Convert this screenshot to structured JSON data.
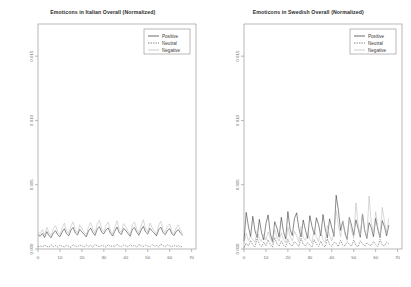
{
  "figure": {
    "background": "#ffffff",
    "panel_count": 2
  },
  "chart_data": [
    {
      "type": "line",
      "title": "Emoticons in Italian Overall (Normalized)",
      "xlabel": "",
      "ylabel": "",
      "xlim": [
        0,
        72
      ],
      "ylim": [
        0.0,
        0.0175
      ],
      "xticks": [
        0,
        10,
        20,
        30,
        40,
        50,
        60,
        70
      ],
      "xtick_labels": [
        "0",
        "10",
        "20",
        "30",
        "40",
        "50",
        "60",
        "70"
      ],
      "yticks": [
        0.0,
        0.005,
        0.01,
        0.015
      ],
      "ytick_labels": [
        "0.000",
        "0.005",
        "0.010",
        "0.015"
      ],
      "grid": false,
      "legend_position": "top-right",
      "legend_entries": [
        {
          "label": "Positive",
          "style": "solid",
          "color": "#2b2b2b"
        },
        {
          "label": "Neutral",
          "style": "dashed",
          "color": "#4a4a4a"
        },
        {
          "label": "Negative",
          "style": "solid",
          "color": "#b8b8b8"
        }
      ],
      "x": [
        0,
        1,
        2,
        3,
        4,
        5,
        6,
        7,
        8,
        9,
        10,
        11,
        12,
        13,
        14,
        15,
        16,
        17,
        18,
        19,
        20,
        21,
        22,
        23,
        24,
        25,
        26,
        27,
        28,
        29,
        30,
        31,
        32,
        33,
        34,
        35,
        36,
        37,
        38,
        39,
        40,
        41,
        42,
        43,
        44,
        45,
        46,
        47,
        48,
        49,
        50,
        51,
        52,
        53,
        54,
        55,
        56,
        57,
        58,
        59,
        60,
        61,
        62,
        63,
        64,
        65,
        66
      ],
      "series": [
        {
          "name": "Positive",
          "style": "solid",
          "color": "#2b2b2b",
          "values": [
            0.00112,
            0.00098,
            0.00121,
            0.0009,
            0.00135,
            0.00104,
            0.00088,
            0.00126,
            0.00142,
            0.0011,
            0.00096,
            0.00131,
            0.00158,
            0.00119,
            0.00102,
            0.00147,
            0.00168,
            0.00124,
            0.00109,
            0.00152,
            0.00133,
            0.00115,
            0.00094,
            0.00141,
            0.00162,
            0.00128,
            0.00106,
            0.00155,
            0.00173,
            0.00131,
            0.00118,
            0.00149,
            0.00164,
            0.00122,
            0.00101,
            0.00138,
            0.00171,
            0.00126,
            0.00113,
            0.00159,
            0.00145,
            0.0012,
            0.00099,
            0.00154,
            0.00167,
            0.0013,
            0.00107,
            0.00148,
            0.00176,
            0.00133,
            0.00116,
            0.00161,
            0.0014,
            0.00123,
            0.00102,
            0.00151,
            0.00169,
            0.00127,
            0.00111,
            0.00144,
            0.00158,
            0.00119,
            0.00105,
            0.00137,
            0.0015,
            0.00122,
            0.00108
          ]
        },
        {
          "name": "Neutral",
          "style": "dashed",
          "color": "#4a4a4a",
          "values": [
            0.00018,
            0.00024,
            0.00016,
            0.00029,
            0.00021,
            0.00014,
            0.00033,
            0.00019,
            0.00026,
            0.00015,
            0.00031,
            0.00022,
            0.00017,
            0.00028,
            0.0002,
            0.00013,
            0.00035,
            0.00023,
            0.00018,
            0.0003,
            0.00025,
            0.00016,
            0.00032,
            0.00021,
            0.00027,
            0.00014,
            0.00036,
            0.00024,
            0.00019,
            0.00029,
            0.00022,
            0.00015,
            0.00034,
            0.0002,
            0.00026,
            0.00017,
            0.00038,
            0.00023,
            0.00018,
            0.00031,
            0.00025,
            0.00016,
            0.00033,
            0.00021,
            0.00028,
            0.00014,
            0.00037,
            0.00024,
            0.0002,
            0.0003,
            0.00023,
            0.00017,
            0.00035,
            0.00022,
            0.00027,
            0.00015,
            0.00039,
            0.00025,
            0.00019,
            0.00032,
            0.00024,
            0.00018,
            0.00029,
            0.00021,
            0.00026,
            0.00016,
            0.00023
          ]
        },
        {
          "name": "Negative",
          "style": "solid",
          "color": "#b8b8b8",
          "values": [
            0.00132,
            0.00118,
            0.00151,
            0.00108,
            0.00169,
            0.00126,
            0.00104,
            0.00158,
            0.00182,
            0.00134,
            0.00112,
            0.00163,
            0.00201,
            0.00143,
            0.0012,
            0.00178,
            0.00212,
            0.00148,
            0.00126,
            0.00189,
            0.00161,
            0.00131,
            0.0011,
            0.00172,
            0.00205,
            0.00152,
            0.00124,
            0.00193,
            0.00224,
            0.00156,
            0.00135,
            0.00184,
            0.00208,
            0.00144,
            0.00116,
            0.00171,
            0.00219,
            0.0015,
            0.00129,
            0.00198,
            0.00174,
            0.00139,
            0.00112,
            0.0019,
            0.00211,
            0.00155,
            0.00122,
            0.00181,
            0.00228,
            0.00158,
            0.00133,
            0.00202,
            0.00168,
            0.00141,
            0.00115,
            0.00186,
            0.00215,
            0.00149,
            0.00127,
            0.00177,
            0.00196,
            0.00137,
            0.00119,
            0.00165,
            0.00188,
            0.00142,
            0.00124
          ]
        }
      ]
    },
    {
      "type": "line",
      "title": "Emoticons in Swedish Overall (Normalized)",
      "xlabel": "",
      "ylabel": "",
      "xlim": [
        0,
        72
      ],
      "ylim": [
        0.0,
        0.0175
      ],
      "xticks": [
        0,
        10,
        20,
        30,
        40,
        50,
        60,
        70
      ],
      "xtick_labels": [
        "0",
        "10",
        "20",
        "30",
        "40",
        "50",
        "60",
        "70"
      ],
      "yticks": [
        0.0,
        0.005,
        0.01,
        0.015
      ],
      "ytick_labels": [
        "0.000",
        "0.005",
        "0.010",
        "0.015"
      ],
      "grid": false,
      "legend_position": "top-right",
      "legend_entries": [
        {
          "label": "Positive",
          "style": "solid",
          "color": "#2b2b2b"
        },
        {
          "label": "Neutral",
          "style": "dashed",
          "color": "#4a4a4a"
        },
        {
          "label": "Negative",
          "style": "solid",
          "color": "#b8b8b8"
        }
      ],
      "x": [
        0,
        1,
        2,
        3,
        4,
        5,
        6,
        7,
        8,
        9,
        10,
        11,
        12,
        13,
        14,
        15,
        16,
        17,
        18,
        19,
        20,
        21,
        22,
        23,
        24,
        25,
        26,
        27,
        28,
        29,
        30,
        31,
        32,
        33,
        34,
        35,
        36,
        37,
        38,
        39,
        40,
        41,
        42,
        43,
        44,
        45,
        46,
        47,
        48,
        49,
        50,
        51,
        52,
        53,
        54,
        55,
        56,
        57,
        58,
        59,
        60,
        61,
        62,
        63,
        64,
        65,
        66
      ],
      "series": [
        {
          "name": "Positive",
          "style": "solid",
          "color": "#2b2b2b",
          "values": [
            0.00062,
            0.00285,
            0.00178,
            0.00096,
            0.00254,
            0.00142,
            0.00088,
            0.00231,
            0.00126,
            0.00072,
            0.00198,
            0.00265,
            0.00119,
            0.00058,
            0.00212,
            0.00164,
            0.00092,
            0.00246,
            0.00135,
            0.00078,
            0.00291,
            0.00153,
            0.00105,
            0.00238,
            0.00281,
            0.00161,
            0.00094,
            0.00225,
            0.00148,
            0.00083,
            0.00259,
            0.00176,
            0.00112,
            0.00243,
            0.00189,
            0.00101,
            0.00268,
            0.00156,
            0.00087,
            0.00234,
            0.00167,
            0.00098,
            0.00418,
            0.00302,
            0.00145,
            0.00216,
            0.00131,
            0.00076,
            0.00248,
            0.00184,
            0.00107,
            0.00227,
            0.00159,
            0.00091,
            0.00272,
            0.00143,
            0.00082,
            0.00205,
            0.00168,
            0.00096,
            0.00239,
            0.00152,
            0.00088,
            0.00221,
            0.00174,
            0.00103,
            0.00186
          ]
        },
        {
          "name": "Neutral",
          "style": "dashed",
          "color": "#4a4a4a",
          "values": [
            0.00012,
            0.00045,
            0.00022,
            0.00068,
            0.00031,
            0.00016,
            0.00082,
            0.00038,
            0.00019,
            0.00054,
            0.00026,
            0.00071,
            0.00035,
            0.00014,
            0.00089,
            0.00042,
            0.00021,
            0.00063,
            0.00029,
            0.00017,
            0.00076,
            0.00033,
            0.00023,
            0.00058,
            0.00041,
            0.00018,
            0.00085,
            0.00036,
            0.00024,
            0.00049,
            0.0003,
            0.00015,
            0.00073,
            0.00039,
            0.0002,
            0.00061,
            0.00027,
            0.00016,
            0.00079,
            0.00034,
            0.00022,
            0.00052,
            0.00044,
            0.00019,
            0.00067,
            0.00032,
            0.00025,
            0.00057,
            0.00037,
            0.00021,
            0.0007,
            0.00029,
            0.00018,
            0.00064,
            0.0004,
            0.00023,
            0.00048,
            0.00033,
            0.00026,
            0.00059,
            0.00035,
            0.0002,
            0.00074,
            0.00031,
            0.00024,
            0.00053,
            0.00038
          ]
        },
        {
          "name": "Negative",
          "style": "solid",
          "color": "#b8b8b8",
          "values": [
            0.00048,
            0.00122,
            0.00066,
            0.00098,
            0.00074,
            0.00052,
            0.00141,
            0.00081,
            0.00059,
            0.00115,
            0.00069,
            0.00133,
            0.00087,
            0.00044,
            0.00152,
            0.00092,
            0.00061,
            0.00126,
            0.00073,
            0.00049,
            0.00168,
            0.00096,
            0.00064,
            0.00138,
            0.00101,
            0.00055,
            0.00175,
            0.00089,
            0.00067,
            0.00124,
            0.00078,
            0.00046,
            0.00159,
            0.00094,
            0.00058,
            0.00147,
            0.00071,
            0.00051,
            0.00182,
            0.00103,
            0.00063,
            0.00129,
            0.00298,
            0.00186,
            0.00097,
            0.00221,
            0.00113,
            0.00068,
            0.00249,
            0.00144,
            0.00082,
            0.00358,
            0.00192,
            0.00105,
            0.00276,
            0.00151,
            0.00089,
            0.00412,
            0.00203,
            0.00118,
            0.00289,
            0.00167,
            0.00094,
            0.00324,
            0.00214,
            0.00126,
            0.00238
          ]
        }
      ]
    }
  ]
}
